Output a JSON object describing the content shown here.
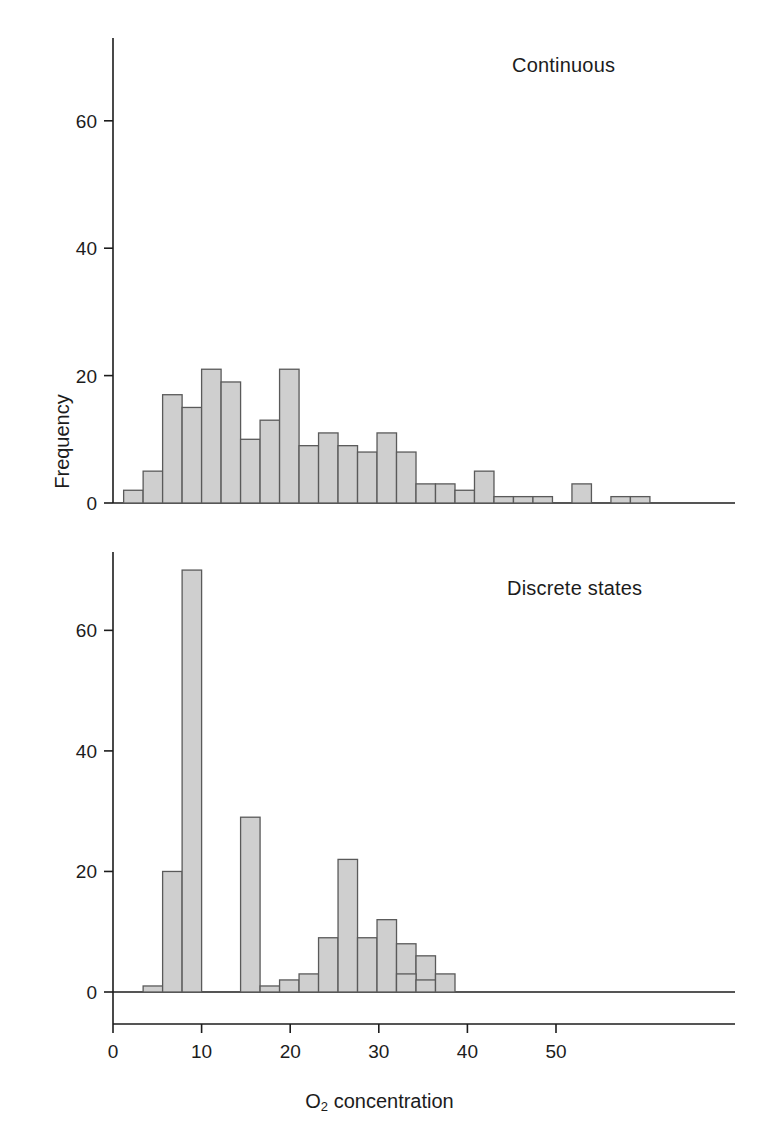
{
  "figure": {
    "ylabel": "Frequency",
    "xlabel_prefix": "O",
    "xlabel_sub": "2",
    "xlabel_suffix": " concentration",
    "bar_fill": "#cfcfcf",
    "bar_stroke": "#5a5a5a",
    "axis_color": "#1c1c1c"
  },
  "panels": [
    {
      "name": "continuous",
      "label": "Continuous",
      "yticks": [
        0,
        20,
        40,
        60
      ],
      "ytick_labels": [
        "0",
        "20",
        "40",
        "60"
      ],
      "show_xticks": false
    },
    {
      "name": "discrete-states",
      "label": "Discrete states",
      "yticks": [
        0,
        20,
        40,
        60
      ],
      "ytick_labels": [
        "0",
        "20",
        "40",
        "60"
      ],
      "show_xticks": true,
      "xticks": [
        0,
        10,
        20,
        30,
        40,
        50
      ],
      "xtick_labels": [
        "0",
        "10",
        "20",
        "30",
        "40",
        "50"
      ]
    }
  ],
  "chart_data": [
    {
      "type": "bar",
      "title": "Continuous",
      "xlabel": "O2 concentration",
      "ylabel": "Frequency",
      "xlim": [
        0,
        53
      ],
      "ylim": [
        0,
        73
      ],
      "bin_width": 2.2,
      "grid": false,
      "bin_starts": [
        1.2,
        3.4,
        5.6,
        7.8,
        10.0,
        12.2,
        14.4,
        16.6,
        18.8,
        21.0,
        23.2,
        25.4,
        27.6,
        29.8,
        32.0,
        34.2,
        36.4,
        38.6,
        40.8,
        43.0,
        45.2,
        47.4,
        49.6
      ],
      "categories": [
        "1.2",
        "3.4",
        "5.6",
        "7.8",
        "10.0",
        "12.2",
        "14.4",
        "16.6",
        "18.8",
        "21.0",
        "23.2",
        "25.4",
        "27.6",
        "29.8",
        "32.0",
        "34.2",
        "36.4",
        "38.6",
        "40.8",
        "43.0",
        "45.2",
        "47.4",
        "49.6"
      ],
      "values": [
        2,
        5,
        17,
        15,
        21,
        19,
        10,
        13,
        21,
        9,
        11,
        9,
        8,
        11,
        8,
        3,
        3,
        2,
        5,
        1,
        1,
        1,
        0,
        3,
        0,
        1,
        1
      ]
    },
    {
      "type": "bar",
      "title": "Discrete states",
      "xlabel": "O2 concentration",
      "ylabel": "Frequency",
      "xlim": [
        0,
        53
      ],
      "ylim": [
        0,
        73
      ],
      "bin_width": 2.2,
      "grid": false,
      "bin_starts": [
        3.4,
        5.6,
        7.8,
        14.4,
        16.6,
        18.8,
        21.0,
        23.2,
        25.4,
        27.6,
        29.8,
        32.0,
        34.2
      ],
      "categories": [
        "3.4",
        "5.6",
        "7.8",
        "14.4",
        "16.6",
        "18.8",
        "21.0",
        "23.2",
        "25.4",
        "27.6",
        "29.8",
        "32.0",
        "34.2"
      ],
      "values": [
        1,
        20,
        70,
        29,
        1,
        2,
        3,
        9,
        22,
        9,
        12,
        8,
        6,
        3,
        2,
        3
      ]
    }
  ]
}
